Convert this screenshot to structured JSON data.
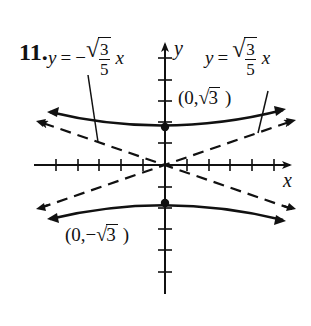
{
  "problem": {
    "number": "11."
  },
  "axes": {
    "x_label": "x",
    "y_label": "y"
  },
  "asymptotes": {
    "negative": {
      "lhs": "y",
      "eq": "=",
      "sign": "−",
      "numerator": "3",
      "denominator": "5",
      "var": "x",
      "text": "y = −√(3/5) x"
    },
    "positive": {
      "lhs": "y",
      "eq": "=",
      "numerator": "3",
      "denominator": "5",
      "var": "x",
      "text": "y = √(3/5) x"
    }
  },
  "vertices": {
    "upper": {
      "open": "(0,",
      "radicand": "3",
      "close": ")",
      "text": "(0, √3)"
    },
    "lower": {
      "open": "(0,−",
      "radicand": "3",
      "close": ")",
      "text": "(0, −√3)"
    }
  },
  "radical_symbol": "√",
  "graph": {
    "type": "hyperbola",
    "orientation": "vertical",
    "a_squared": 3,
    "b_squared": 5,
    "x_ticks_each_side": 5,
    "y_ticks_up": 4,
    "y_ticks_down": 6,
    "line_color": "#111111"
  }
}
